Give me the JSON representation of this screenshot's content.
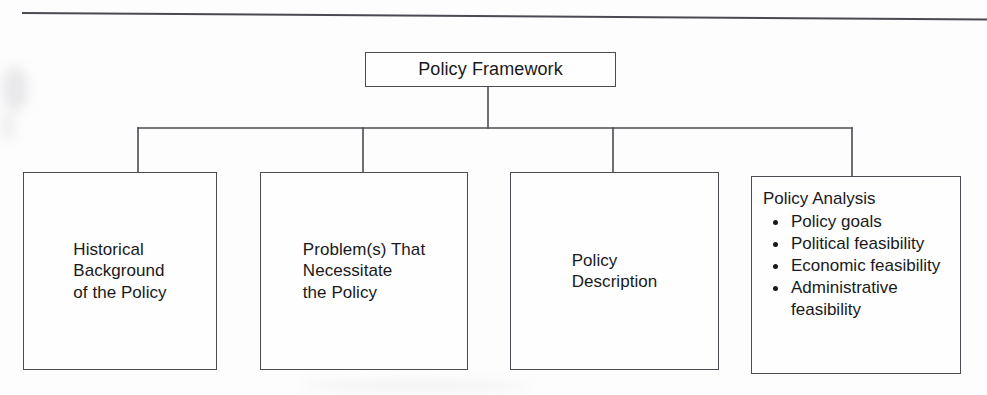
{
  "diagram": {
    "type": "hierarchy-tree",
    "title": "Policy Framework",
    "top_rule": "horizontal-rule",
    "line_color": "#4b4b52",
    "background_color": "#fdfdfd",
    "text_color": "#1a1a1a",
    "root": {
      "label": "Policy Framework"
    },
    "children": [
      {
        "id": "historical",
        "label": "Historical\nBackground\nof the Policy"
      },
      {
        "id": "problems",
        "label": "Problem(s) That\nNecessitate\nthe Policy"
      },
      {
        "id": "description",
        "label": "Policy\nDescription"
      },
      {
        "id": "analysis",
        "heading": "Policy Analysis",
        "bullets": [
          "Policy goals",
          "Political feasibility",
          "Economic feasibility",
          "Administrative feasibility"
        ]
      }
    ]
  }
}
